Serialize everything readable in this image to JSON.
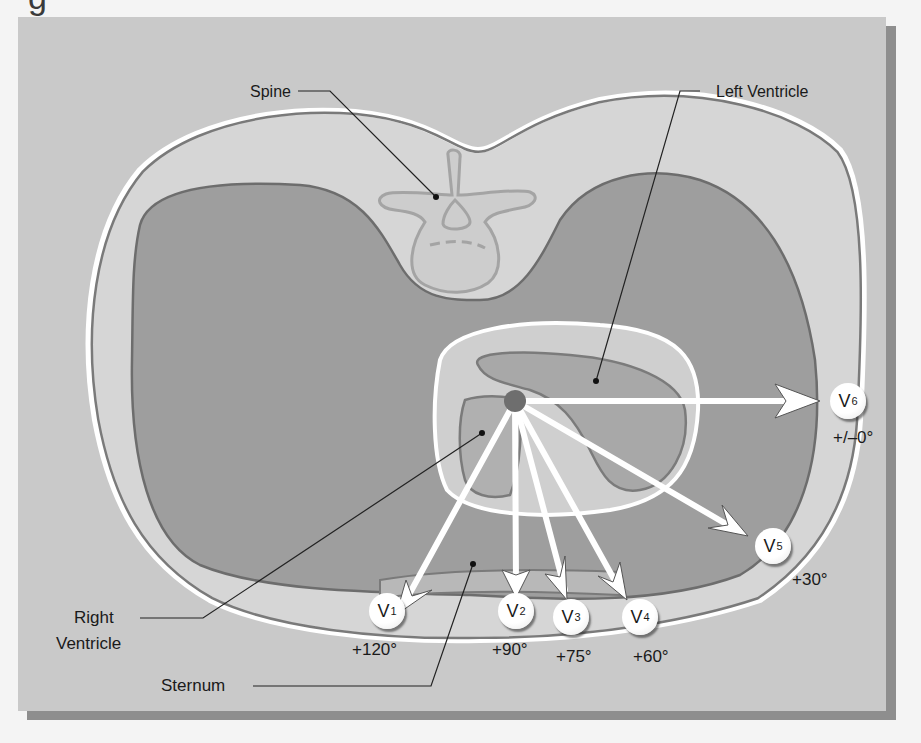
{
  "diagram": {
    "title_fragment": "g",
    "colors": {
      "background": "#c9c9c9",
      "body_outline_fill": "#d4d4d4",
      "lung_fill": "#9d9d9d",
      "heart_outer_fill": "#cfcfcf",
      "ventricle_fill": "#acacac",
      "vector_arrow": "#ffffff",
      "origin_dot": "#6e6e6e"
    },
    "labels": {
      "spine": "Spine",
      "left_ventricle": "Left Ventricle",
      "right_ventricle_line1": "Right",
      "right_ventricle_line2": "Ventricle",
      "sternum": "Sternum"
    },
    "leads": [
      {
        "name": "V",
        "sub": "1",
        "angle": "+120°"
      },
      {
        "name": "V",
        "sub": "2",
        "angle": "+90°"
      },
      {
        "name": "V",
        "sub": "3",
        "angle": "+75°"
      },
      {
        "name": "V",
        "sub": "4",
        "angle": "+60°"
      },
      {
        "name": "V",
        "sub": "5",
        "angle": "+30°"
      },
      {
        "name": "V",
        "sub": "6",
        "angle": "+/–0°"
      }
    ]
  }
}
